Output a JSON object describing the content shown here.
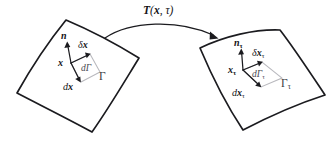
{
  "figure": {
    "background_color": "#ffffff",
    "ink_color": "#1b1b1f",
    "parallelogram_color": "#b9b9be"
  },
  "map_arrow": {
    "label_symbol": "T",
    "label_open_paren": "(",
    "label_arg_x": "x",
    "label_comma": ", ",
    "label_arg_tau": "τ",
    "label_close_paren": ")",
    "label_full": "T(x, τ)"
  },
  "reference_patch": {
    "domain_label": "Γ",
    "point_label": "x",
    "normal_label": "n",
    "tangent_delta_label_main": "δ",
    "tangent_delta_label_var": "x",
    "tangent_d_label_main": "d",
    "tangent_d_label_var": "x",
    "area_label_d": "d",
    "area_label_gamma": "Γ"
  },
  "deformed_patch": {
    "domain_label": "Γ",
    "domain_subscript": "τ",
    "point_label": "x",
    "point_subscript": "τ",
    "normal_label": "n",
    "normal_subscript": "τ",
    "tangent_delta_label_main": "δ",
    "tangent_delta_label_var": "x",
    "tangent_delta_subscript": "τ",
    "tangent_d_label_main": "d",
    "tangent_d_label_var": "x",
    "tangent_d_subscript": "τ",
    "area_label_d": "d",
    "area_label_gamma": "Γ",
    "area_subscript": "τ"
  }
}
